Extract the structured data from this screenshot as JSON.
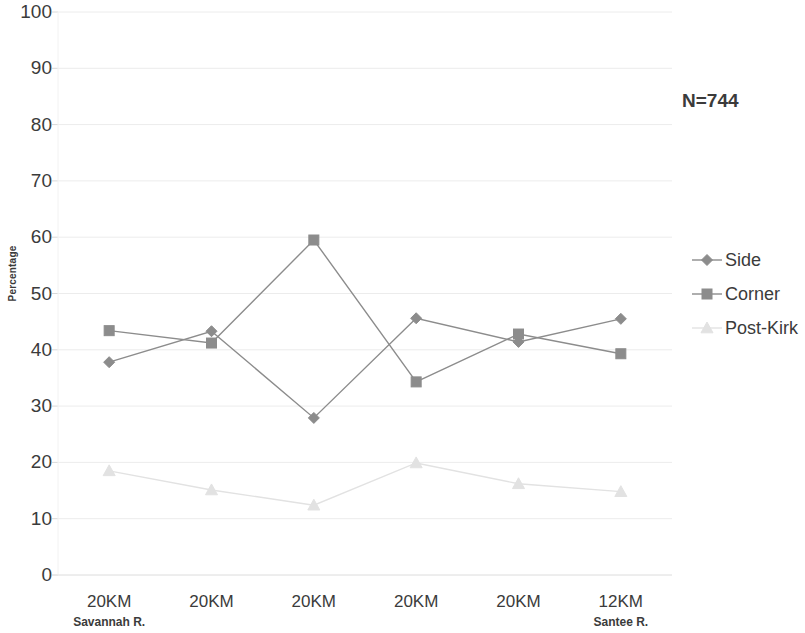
{
  "chart_data": {
    "type": "line",
    "title": "",
    "xlabel": "",
    "ylabel": "Percentage",
    "ylim": [
      0,
      100
    ],
    "ytick_values": [
      100,
      90,
      80,
      70,
      60,
      50,
      40,
      30,
      20,
      10,
      0
    ],
    "categories": [
      "20KM",
      "20KM",
      "20KM",
      "20KM",
      "20KM",
      "12KM"
    ],
    "category_sublabels": [
      "Savannah R.",
      "",
      "",
      "",
      "",
      "Santee R."
    ],
    "grid": "horizontal",
    "legend_position": "right",
    "annotation": "N=744",
    "series": [
      {
        "name": "Side",
        "marker": "diamond",
        "color": "#8c8c8c",
        "values": [
          37.8,
          43.3,
          27.9,
          45.6,
          41.4,
          45.5
        ]
      },
      {
        "name": "Corner",
        "marker": "square",
        "color": "#8c8c8c",
        "values": [
          43.4,
          41.2,
          59.5,
          34.3,
          42.8,
          39.3
        ]
      },
      {
        "name": "Post-Kirk",
        "marker": "triangle",
        "color": "#e2e2e2",
        "values": [
          18.5,
          15.1,
          12.4,
          19.9,
          16.2,
          14.8
        ]
      }
    ]
  },
  "axis": {
    "y_title": "Percentage"
  },
  "legend": {
    "entries": [
      {
        "label": "Side"
      },
      {
        "label": "Corner"
      },
      {
        "label": "Post-Kirk"
      }
    ]
  },
  "annotation": {
    "sample_size": "N=744"
  }
}
